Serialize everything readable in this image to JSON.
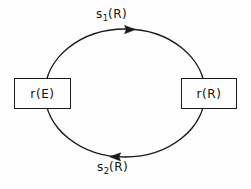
{
  "figure": {
    "type": "cycle-diagram",
    "width": 251,
    "height": 189,
    "background_color": "#fefefe",
    "stroke_color": "#1a1a1a",
    "text_color": "#111111"
  },
  "nodes": [
    {
      "id": "left",
      "label": "r(E)",
      "label_base": "r(E)",
      "x": 14,
      "y": 78,
      "width": 57,
      "height": 31,
      "shape": "rectangle"
    },
    {
      "id": "right",
      "label": "r(R)",
      "label_base": "r(R)",
      "x": 181,
      "y": 78,
      "width": 56,
      "height": 31,
      "shape": "rectangle"
    }
  ],
  "edges": [
    {
      "id": "top",
      "from": "left",
      "to": "right",
      "direction": "left-to-right",
      "label_prefix": "s",
      "label_subscript": "1",
      "label_suffix": "(R)",
      "label_full": "s1(R)",
      "label_position": "above-arc",
      "arrowhead": "right",
      "arrowhead_x": 133,
      "arrowhead_y": 30
    },
    {
      "id": "bottom",
      "from": "right",
      "to": "left",
      "direction": "right-to-left",
      "label_prefix": "s",
      "label_subscript": "2",
      "label_suffix": "(R)",
      "label_full": "s2(R)",
      "label_position": "below-arc",
      "arrowhead": "left",
      "arrowhead_x": 115,
      "arrowhead_y": 156
    }
  ],
  "ellipse": {
    "center_x": 125,
    "center_y": 93,
    "radius_x": 80,
    "radius_y": 64,
    "stroke_width": 1.5
  }
}
